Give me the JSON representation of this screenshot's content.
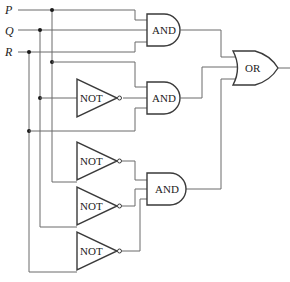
{
  "diagram": {
    "type": "logic-circuit",
    "inputs": [
      {
        "id": "P",
        "label": "P"
      },
      {
        "id": "Q",
        "label": "Q"
      },
      {
        "id": "R",
        "label": "R"
      }
    ],
    "gates": {
      "and1": {
        "label": "AND",
        "inputs": [
          "P",
          "Q",
          "R"
        ]
      },
      "not1": {
        "label": "NOT",
        "inputs": [
          "Q"
        ]
      },
      "and2": {
        "label": "AND",
        "inputs": [
          "P",
          "NOT Q",
          "R"
        ]
      },
      "not2": {
        "label": "NOT",
        "inputs": [
          "P"
        ]
      },
      "not3": {
        "label": "NOT",
        "inputs": [
          "Q"
        ]
      },
      "not4": {
        "label": "NOT",
        "inputs": [
          "R"
        ]
      },
      "and3": {
        "label": "AND",
        "inputs": [
          "NOT P",
          "NOT Q",
          "NOT R"
        ]
      },
      "or1": {
        "label": "OR",
        "inputs": [
          "and1",
          "and2",
          "and3"
        ]
      }
    },
    "colors": {
      "wire": "#6a6a6a",
      "gate_stroke": "#3a3a3a",
      "background": "#ffffff"
    }
  }
}
